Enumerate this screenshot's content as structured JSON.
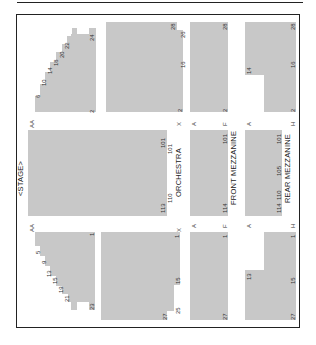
{
  "chart": {
    "stage_label": "<STAGE>",
    "sections": {
      "orchestra": "ORCHESTRA",
      "front_mezzanine": "FRONT MEZZANINE",
      "rear_mezzanine": "REAR MEZZANINE"
    },
    "row_labels": {
      "aa_top": "AA",
      "aa_bottom": "AA",
      "x_top": "X",
      "x_bottom": "X",
      "a_front_top": "A",
      "f_top": "F",
      "a_front_bottom": "A",
      "f_bottom": "F",
      "a_rear_top": "A",
      "h_top": "H",
      "a_rear_bottom": "A",
      "h_bottom": "H"
    },
    "seat_numbers": {
      "upper_left": [
        "6",
        "10",
        "14",
        "18",
        "20",
        "22",
        "24",
        "2"
      ],
      "upper_orch": [
        "28",
        "26",
        "16",
        "2"
      ],
      "upper_front": [
        "28",
        "2"
      ],
      "upper_rear": [
        "28",
        "14",
        "16",
        "2"
      ],
      "center_orch": [
        "101",
        "101",
        "110",
        "113"
      ],
      "center_front": [
        "101",
        "114"
      ],
      "center_rear": [
        "101",
        "105",
        "110",
        "114"
      ],
      "lower_left": [
        "1",
        "5",
        "9",
        "13",
        "15",
        "19",
        "21",
        "23"
      ],
      "lower_orch": [
        "1",
        "15",
        "25",
        "27"
      ],
      "lower_front": [
        "1",
        "27"
      ],
      "lower_rear": [
        "1",
        "13",
        "15",
        "27"
      ]
    }
  }
}
